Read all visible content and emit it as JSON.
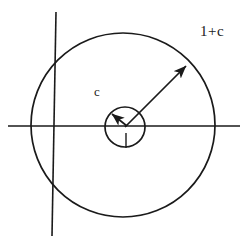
{
  "figure": {
    "background_color": "#ffffff",
    "stroke_color": "#1a1a1a",
    "width": 250,
    "height": 251
  },
  "axes": {
    "horizontal": {
      "name": "real-axis",
      "x1": 8,
      "y1": 126,
      "x2": 240,
      "y2": 126,
      "stroke_width": 1.6
    },
    "vertical": {
      "name": "imaginary-axis",
      "x1": 56,
      "y1": 12,
      "x2": 52,
      "y2": 236,
      "stroke_width": 1.6
    }
  },
  "circles": [
    {
      "name": "outer-circle",
      "cx": 123,
      "cy": 125,
      "r": 92,
      "stroke_width": 1.7,
      "radius_value": "1+c"
    },
    {
      "name": "inner-circle",
      "cx": 125,
      "cy": 127,
      "r": 20,
      "stroke_width": 1.7,
      "radius_value": "1"
    }
  ],
  "arrows": [
    {
      "name": "outer-radius-arrow",
      "x1": 125,
      "y1": 127,
      "x2": 189,
      "y2": 63,
      "stroke_width": 1.7,
      "label": "1+c"
    },
    {
      "name": "inner-radius-arrow",
      "x1": 127,
      "y1": 126,
      "x2": 110,
      "y2": 112,
      "stroke_width": 1.7,
      "label": "1"
    }
  ],
  "ticks": [
    {
      "name": "unit-radius-stroke",
      "x1": 126,
      "y1": 133,
      "x2": 126,
      "y2": 148,
      "stroke_width": 1.4
    }
  ],
  "labels": {
    "outer_radius": {
      "text": "1+c",
      "x": 200,
      "y": 24
    },
    "inner_region": {
      "text": "c",
      "x": 94,
      "y": 85
    },
    "unit_radius": {
      "text": "1",
      "x": 121,
      "y": 129
    }
  }
}
